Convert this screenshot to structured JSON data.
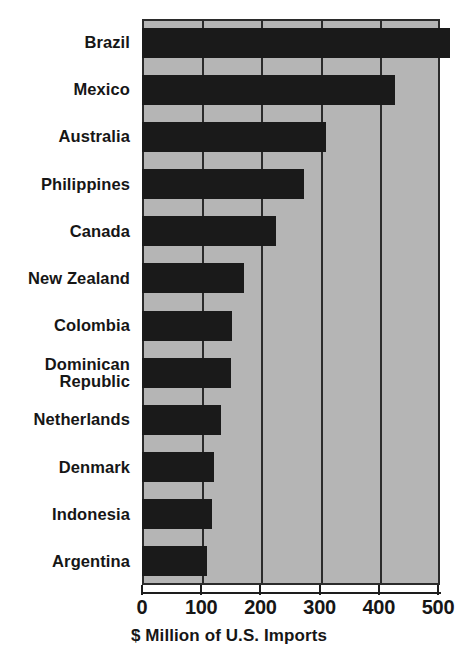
{
  "chart_data": {
    "type": "bar",
    "orientation": "horizontal",
    "title": "",
    "xlabel": "$ Million of U.S. Imports",
    "ylabel": "",
    "categories": [
      "Brazil",
      "Mexico",
      "Australia",
      "Philippines",
      "Canada",
      "New Zealand",
      "Colombia",
      "Dominican\nRepublic",
      "Netherlands",
      "Denmark",
      "Indonesia",
      "Argentina"
    ],
    "values": [
      520,
      428,
      311,
      273,
      227,
      172,
      152,
      151,
      133,
      122,
      118,
      110
    ],
    "xlim": [
      0,
      500
    ],
    "xticks": [
      0,
      100,
      200,
      300,
      400,
      500
    ],
    "xtick_labels": [
      "0",
      "100",
      "200",
      "300",
      "400",
      "500"
    ],
    "grid": true,
    "grid_axis": "x",
    "legend": false,
    "colors": {
      "bar": "#1a1a1a",
      "plot_background": "#b5b5b5",
      "gridline": "#2b2b2b",
      "axis": "#1d1d1d",
      "text": "#161616",
      "page_background": "#ffffff"
    }
  }
}
